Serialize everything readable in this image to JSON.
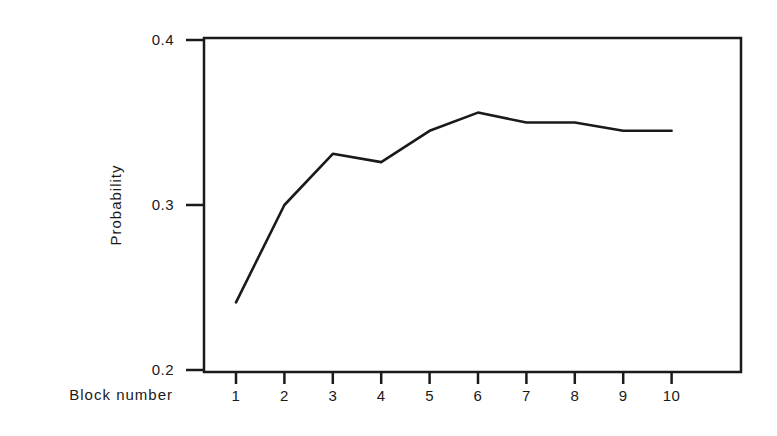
{
  "chart_data": {
    "type": "line",
    "title": "",
    "xlabel": "Block number",
    "ylabel": "Probability",
    "categories": [
      "1",
      "2",
      "3",
      "4",
      "5",
      "6",
      "7",
      "8",
      "9",
      "10"
    ],
    "x": [
      1,
      2,
      3,
      4,
      5,
      6,
      7,
      8,
      9,
      10
    ],
    "values": [
      0.241,
      0.3,
      0.331,
      0.326,
      0.345,
      0.356,
      0.35,
      0.35,
      0.345,
      0.345
    ],
    "ylim": [
      0.2,
      0.4
    ],
    "yticks": [
      "0.2",
      "0.3",
      "0.4"
    ],
    "xticks": [
      "1",
      "2",
      "3",
      "4",
      "5",
      "6",
      "7",
      "8",
      "9",
      "10"
    ],
    "grid": false,
    "legend": null,
    "line_color": "#1a1a1a"
  }
}
